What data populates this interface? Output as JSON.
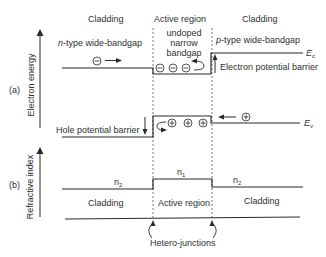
{
  "panel_a": {
    "panel_label": "(a)",
    "axis_label": "Electron energy",
    "regions": {
      "left": "Cladding",
      "middle": "Active region",
      "right": "Cladding"
    },
    "left_type_prefix": "n",
    "left_type_suffix": "-type wide-bandgap",
    "middle_desc_line1": "undoped",
    "middle_desc_line2": "narrow",
    "middle_desc_line3": "bandgap",
    "right_type_prefix": "p",
    "right_type_suffix": "-type wide-bandgap",
    "electron_barrier_label": "Electron potential barrier",
    "hole_barrier_label": "Hole potential barrier",
    "ec_label": "E",
    "ec_sub": "c",
    "ev_label": "E",
    "ev_sub": "v",
    "electron_symbol": "⊖",
    "hole_symbol": "⊕",
    "electrons_in_well": 3,
    "holes_in_well": 3
  },
  "panel_b": {
    "panel_label": "(b)",
    "axis_label": "Refractive index",
    "n_left": "n",
    "n_left_sub": "2",
    "n_middle": "n",
    "n_middle_sub": "1",
    "n_right": "n",
    "n_right_sub": "2",
    "regions": {
      "left": "Cladding",
      "middle": "Active region",
      "right": "Cladding"
    }
  },
  "annotation": {
    "junctions_label": "Hetero-junctions"
  },
  "colors": {
    "line": "#2a2a2a",
    "dashed": "#555555",
    "background": "#ffffff"
  }
}
